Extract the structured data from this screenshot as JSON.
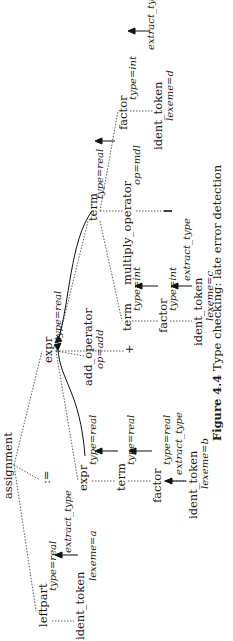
{
  "diagram": {
    "nodes": {
      "assignment": "assignment",
      "leftpart": "leftpart",
      "leftpart_type": "type=real",
      "leftpart_ident": "ident_token",
      "leftpart_lexeme": "lexeme=a",
      "leftpart_extract": "extract_type",
      "assign_op": ":=",
      "expr_left": "expr",
      "expr_left_type": "type=real",
      "term_left": "term",
      "term_left_type": "type=real",
      "factor_left": "factor",
      "factor_left_type": "type=real",
      "ident_b": "ident_token",
      "lexeme_b": "lexeme=b",
      "extract_b": "extract_type",
      "expr_top": "expr",
      "expr_top_type": "type=real",
      "add_operator": "add_operator",
      "add_op_value": "op=add",
      "plus": "+",
      "term_mid": "term",
      "term_mid_type": "type=int",
      "factor_mid": "factor",
      "factor_mid_type": "type=int",
      "ident_c": "ident_token",
      "lexeme_c": "lexeme=c",
      "extract_c": "extract_type",
      "term_right": "term",
      "term_right_type": "type=real",
      "multiply_operator": "multiply_operator",
      "mul_op_value": "op=mdl",
      "mul_symbol": "|",
      "factor_right": "factor",
      "factor_right_type": "type=int",
      "ident_d": "ident_token",
      "lexeme_d": "lexeme=d",
      "extract_d": "extract_type"
    },
    "caption": {
      "label": "Figure 4.4",
      "text": "Type checking: late error detection"
    }
  }
}
